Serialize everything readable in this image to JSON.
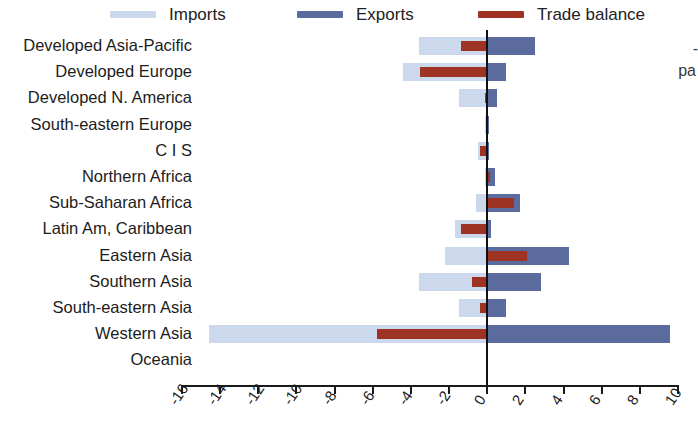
{
  "legend": {
    "items": [
      {
        "label": "Imports",
        "color": "#ccd9ec",
        "key": "imports"
      },
      {
        "label": "Exports",
        "color": "#5b6b9e",
        "key": "exports"
      },
      {
        "label": "Trade balance",
        "color": "#9e3324",
        "key": "balance"
      }
    ]
  },
  "edge_text": {
    "fragment_1": "-",
    "fragment_2": "pa"
  },
  "chart_data": {
    "type": "bar",
    "orientation": "horizontal",
    "title": "",
    "xlabel": "",
    "ylabel": "",
    "xlim": [
      -16,
      10
    ],
    "xticks": [
      -16,
      -14,
      -12,
      -10,
      -8,
      -6,
      -4,
      -2,
      0,
      2,
      4,
      6,
      8,
      10
    ],
    "xtick_labels": [
      "-16",
      "-14",
      "-12",
      "-10",
      "-8",
      "-6",
      "-4",
      "-2",
      "0",
      "2",
      "4",
      "6",
      "8",
      "10"
    ],
    "grid": false,
    "legend_position": "top",
    "zero_reference_line": true,
    "categories": [
      "Developed Asia-Pacific",
      "Developed Europe",
      "Developed N. America",
      "South-eastern Europe",
      "C I S",
      "Northern Africa",
      "Sub-Saharan Africa",
      "Latin Am, Caribbean",
      "Eastern Asia",
      "Southern Asia",
      "South-eastern Asia",
      "Western Asia",
      "Oceania"
    ],
    "series": [
      {
        "name": "Imports",
        "color": "#ccd9ec",
        "values": [
          -3.6,
          -4.4,
          -1.5,
          -0.1,
          -0.5,
          -0.1,
          -0.6,
          -1.7,
          -2.2,
          -3.6,
          -1.5,
          -14.6,
          0
        ]
      },
      {
        "name": "Exports",
        "color": "#5b6b9e",
        "values": [
          2.5,
          1.0,
          0.5,
          0.1,
          0.1,
          0.4,
          1.7,
          0.2,
          4.3,
          2.8,
          1.0,
          9.6,
          0
        ]
      },
      {
        "name": "Trade balance",
        "color": "#9e3324",
        "values": [
          -1.4,
          -3.5,
          -0.1,
          0.0,
          -0.4,
          0.15,
          1.4,
          -1.4,
          2.1,
          -0.8,
          -0.4,
          -5.8,
          0
        ]
      }
    ]
  }
}
